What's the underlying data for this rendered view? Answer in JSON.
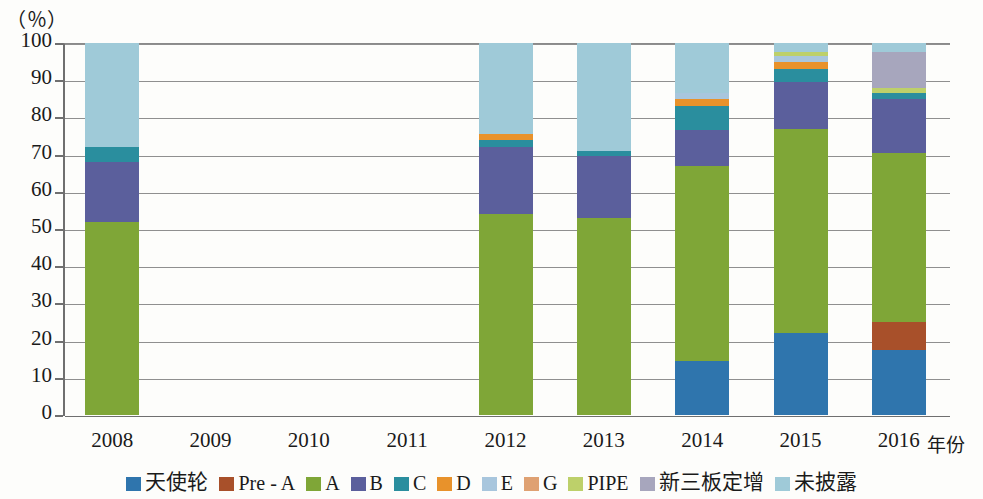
{
  "chart_data": {
    "type": "bar",
    "stacked": true,
    "stack_mode": "percent",
    "title": "",
    "subtitle": "",
    "xlabel": "年份",
    "ylabel": "（％）",
    "y_unit_label": "（％）",
    "grid": true,
    "legend_position": "bottom",
    "ylim": [
      0,
      100
    ],
    "yticks": [
      0,
      10,
      20,
      30,
      40,
      50,
      60,
      70,
      80,
      90,
      100
    ],
    "ytick_labels": [
      "0",
      "10",
      "20",
      "30",
      "40",
      "50",
      "60",
      "70",
      "80",
      "90",
      "100"
    ],
    "categories": [
      "2008",
      "2009",
      "2010",
      "2011",
      "2012",
      "2013",
      "2014",
      "2015",
      "2016"
    ],
    "series": [
      {
        "name": "天使轮",
        "color": "#2f75ad",
        "values": [
          0,
          0,
          0,
          0,
          0,
          0,
          14.5,
          22.0,
          17.5
        ]
      },
      {
        "name": "Pre - A",
        "color": "#a8502a",
        "values": [
          0,
          0,
          0,
          0,
          0,
          0,
          0,
          0,
          7.5
        ]
      },
      {
        "name": "A",
        "color": "#7fa637",
        "values": [
          52.0,
          0,
          0,
          0,
          54.0,
          53.0,
          52.5,
          55.0,
          45.5
        ]
      },
      {
        "name": "B",
        "color": "#5b5f9c",
        "values": [
          16.0,
          0,
          0,
          0,
          18.0,
          16.5,
          9.5,
          12.5,
          14.5
        ]
      },
      {
        "name": "C",
        "color": "#2a8e9e",
        "values": [
          4.0,
          0,
          0,
          0,
          2.0,
          1.5,
          6.5,
          3.5,
          1.5
        ]
      },
      {
        "name": "D",
        "color": "#e8922b",
        "values": [
          0,
          0,
          0,
          0,
          1.5,
          0,
          2.0,
          2.0,
          0
        ]
      },
      {
        "name": "E",
        "color": "#a8c6dd",
        "values": [
          0,
          0,
          0,
          0,
          0,
          0,
          1.5,
          1.5,
          0
        ]
      },
      {
        "name": "G",
        "color": "#dfa172",
        "values": [
          0,
          0,
          0,
          0,
          0,
          0,
          0,
          0,
          0
        ]
      },
      {
        "name": "PIPE",
        "color": "#bdd06a",
        "values": [
          0,
          0,
          0,
          0,
          0,
          0,
          0,
          1.0,
          1.5
        ]
      },
      {
        "name": "新三板定增",
        "color": "#a7a6bd",
        "values": [
          0,
          0,
          0,
          0,
          0,
          0,
          0,
          0,
          9.5
        ]
      },
      {
        "name": "未披露",
        "color": "#9fcad8",
        "values": [
          28.0,
          0,
          0,
          0,
          24.5,
          29.0,
          13.5,
          2.5,
          2.5
        ]
      }
    ],
    "stacked_tops": {
      "2008": {
        "A": 52.0,
        "B": 68.0,
        "C": 72.0,
        "未披露": 100
      },
      "2012": {
        "A": 54.0,
        "B": 72.0,
        "C": 74.0,
        "D": 75.5,
        "未披露": 100
      },
      "2013": {
        "A": 53.0,
        "B": 69.5,
        "C": 71.0,
        "未披露": 100
      },
      "2014": {
        "天使轮": 14.5,
        "A": 67.0,
        "B": 76.5,
        "C": 83.0,
        "D": 85.0,
        "E": 86.5,
        "未披露": 100
      },
      "2015": {
        "天使轮": 22.0,
        "A": 77.0,
        "B": 89.5,
        "C": 93.0,
        "D": 95.0,
        "E": 96.5,
        "PIPE": 97.5,
        "未披露": 100
      },
      "2016": {
        "天使轮": 17.5,
        "Pre - A": 25.0,
        "A": 70.5,
        "B": 85.0,
        "C": 86.5,
        "PIPE": 88.0,
        "新三板定增": 97.5,
        "未披露": 100
      }
    }
  },
  "axis": {
    "y_unit": "（％）",
    "x_title": "年份",
    "x_labels": [
      "2008",
      "2009",
      "2010",
      "2011",
      "2012",
      "2013",
      "2014",
      "2015",
      "2016"
    ],
    "y_labels": [
      "100",
      "90",
      "80",
      "70",
      "60",
      "50",
      "40",
      "30",
      "20",
      "10",
      "0"
    ]
  },
  "legend": {
    "items": [
      {
        "label": "天使轮",
        "color": "#2f75ad",
        "cjk": true
      },
      {
        "label": "Pre - A",
        "color": "#a8502a",
        "cjk": false
      },
      {
        "label": "A",
        "color": "#7fa637",
        "cjk": false
      },
      {
        "label": "B",
        "color": "#5b5f9c",
        "cjk": false
      },
      {
        "label": "C",
        "color": "#2a8e9e",
        "cjk": false
      },
      {
        "label": "D",
        "color": "#e8922b",
        "cjk": false
      },
      {
        "label": "E",
        "color": "#a8c6dd",
        "cjk": false
      },
      {
        "label": "G",
        "color": "#dfa172",
        "cjk": false
      },
      {
        "label": "PIPE",
        "color": "#bdd06a",
        "cjk": false
      },
      {
        "label": "新三板定增",
        "color": "#a7a6bd",
        "cjk": true
      },
      {
        "label": "未披露",
        "color": "#9fcad8",
        "cjk": true
      }
    ]
  },
  "colors": {
    "grid": "#8f8f8f",
    "axis": "#6f6f6f",
    "background": "#fdfdfb",
    "text": "#1a1a1a"
  }
}
